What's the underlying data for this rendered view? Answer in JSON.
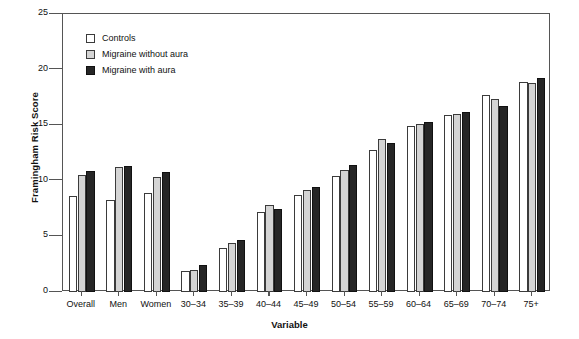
{
  "chart_data": {
    "type": "bar",
    "title": "",
    "xlabel": "Variable",
    "ylabel": "Framingham Risk Score",
    "ylim": [
      0,
      25
    ],
    "yticks": [
      0,
      5,
      10,
      15,
      20,
      25
    ],
    "grid": false,
    "legend_position": "top-left",
    "categories": [
      "Overall",
      "Men",
      "Women",
      "30–34",
      "35–39",
      "40–44",
      "45–49",
      "50–54",
      "55–59",
      "60–64",
      "65–69",
      "70–74",
      "75+"
    ],
    "series": [
      {
        "name": "Controls",
        "color": "#ffffff",
        "values": [
          8.6,
          8.3,
          8.9,
          1.9,
          4.0,
          7.2,
          8.7,
          10.4,
          12.8,
          14.9,
          15.9,
          17.7,
          18.9
        ]
      },
      {
        "name": "Migraine without aura",
        "color": "#d4d4d4",
        "values": [
          10.5,
          11.2,
          10.3,
          2.0,
          4.4,
          7.8,
          9.2,
          11.0,
          13.8,
          15.1,
          16.0,
          17.4,
          18.8
        ]
      },
      {
        "name": "Migraine with aura",
        "color": "#262626",
        "values": [
          10.9,
          11.3,
          10.8,
          2.4,
          4.7,
          7.5,
          9.4,
          11.4,
          13.4,
          15.3,
          16.2,
          16.7,
          19.2
        ]
      }
    ]
  },
  "axis": {
    "y_title": "Framingham Risk Score",
    "x_title": "Variable",
    "y_tick_labels": [
      "25",
      "20",
      "15",
      "10",
      "5",
      "0"
    ]
  },
  "legend": {
    "items": [
      {
        "label": "Controls",
        "swatch": "white-square-swatch"
      },
      {
        "label": "Migraine without aura",
        "swatch": "gray-square-swatch"
      },
      {
        "label": "Migraine with aura",
        "swatch": "black-square-swatch"
      }
    ]
  }
}
